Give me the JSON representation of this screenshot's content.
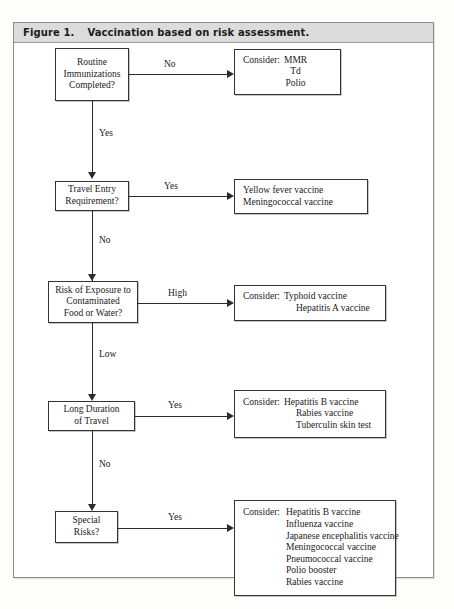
{
  "figure": {
    "label": "Figure 1.",
    "caption": "Vaccination based on risk assessment."
  },
  "flow": {
    "decisions": [
      {
        "id": "routine-immunizations",
        "lines": [
          "Routine",
          "Immunizations",
          "Completed?"
        ]
      },
      {
        "id": "travel-entry-requirement",
        "lines": [
          "Travel Entry",
          "Requirement?"
        ]
      },
      {
        "id": "risk-of-exposure",
        "lines": [
          "Risk of Exposure to",
          "Contaminated",
          "Food or Water?"
        ]
      },
      {
        "id": "long-duration-of-travel",
        "lines": [
          "Long Duration",
          "of Travel"
        ]
      },
      {
        "id": "special-risks",
        "lines": [
          "Special",
          "Risks?"
        ]
      }
    ],
    "branch_labels": {
      "routine_to_outcome": "No",
      "routine_to_next": "Yes",
      "travel_to_outcome": "Yes",
      "travel_to_next": "No",
      "risk_to_outcome": "High",
      "risk_to_next": "Low",
      "duration_to_outcome": "Yes",
      "duration_to_next": "No",
      "special_to_outcome": "Yes"
    },
    "outcomes": [
      {
        "id": "outcome-routine",
        "prefix": "Consider:",
        "items": [
          "MMR",
          "Td",
          "Polio"
        ]
      },
      {
        "id": "outcome-travel-entry",
        "prefix": "",
        "items": [
          "Yellow fever vaccine",
          "Meningococcal vaccine"
        ]
      },
      {
        "id": "outcome-exposure",
        "prefix": "Consider:",
        "items": [
          "Typhoid vaccine",
          "Hepatitis A vaccine"
        ]
      },
      {
        "id": "outcome-long-duration",
        "prefix": "Consider:",
        "items": [
          "Hepatitis B vaccine",
          "Rabies vaccine",
          "Tuberculin skin test"
        ]
      },
      {
        "id": "outcome-special-risks",
        "prefix": "Consider:",
        "items": [
          "Hepatitis B vaccine",
          "Influenza vaccine",
          "Japanese encephalitis vaccine",
          "Meningococcal vaccine",
          "Pneumococcal vaccine",
          "Polio booster",
          "Rabies vaccine"
        ]
      }
    ]
  }
}
